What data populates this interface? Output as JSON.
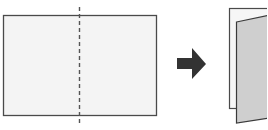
{
  "diagram": {
    "steps": [
      {
        "id": "flat-sheet",
        "label": "",
        "fold_line": "dashed-vertical-center"
      },
      {
        "id": "arrow",
        "label": ""
      },
      {
        "id": "folded-sheet",
        "label": ""
      }
    ],
    "colors": {
      "sheet_fill": "#f4f4f4",
      "sheet_stroke": "#4a4a4a",
      "fold_line": "#555555",
      "arrow": "#333333",
      "front_panel": "#cfcfcf"
    }
  }
}
